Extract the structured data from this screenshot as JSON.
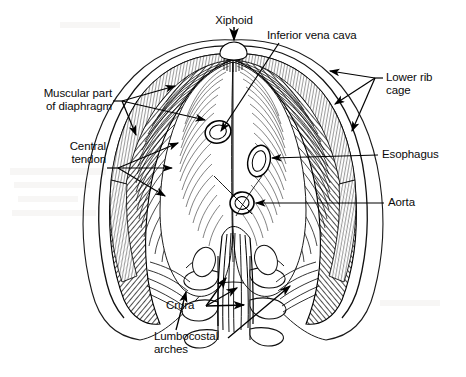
{
  "figure": {
    "background_color": "#ffffff",
    "ink_color": "#000000",
    "width": 466,
    "height": 377
  },
  "labels": {
    "xiphoid": "Xiphoid",
    "inferior_vena_cava": "Inferior vena cava",
    "lower_rib_cage_line1": "Lower rib",
    "lower_rib_cage_line2": "cage",
    "esophagus": "Esophagus",
    "aorta": "Aorta",
    "muscular_part_line1": "Muscular part",
    "muscular_part_line2": "of diaphragm",
    "central_tendon_line1": "Central",
    "central_tendon_line2": "tendon",
    "crura": "Crura",
    "lumbocostal_line1": "Lumbocostal",
    "lumbocostal_line2": "arches"
  },
  "structures": [
    {
      "name": "xiphoid-process",
      "label": "Xiphoid"
    },
    {
      "name": "inferior-vena-cava-opening",
      "label": "Inferior vena cava"
    },
    {
      "name": "esophageal-hiatus",
      "label": "Esophagus"
    },
    {
      "name": "aortic-hiatus",
      "label": "Aorta"
    },
    {
      "name": "muscular-part-of-diaphragm",
      "label": "Muscular part of diaphragm"
    },
    {
      "name": "central-tendon",
      "label": "Central tendon"
    },
    {
      "name": "lower-rib-cage",
      "label": "Lower rib cage"
    },
    {
      "name": "crura",
      "label": "Crura"
    },
    {
      "name": "lumbocostal-arches",
      "label": "Lumbocostal arches"
    }
  ]
}
